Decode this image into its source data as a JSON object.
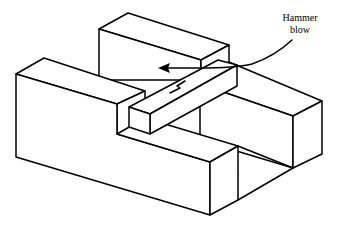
{
  "diagram": {
    "annotation": {
      "line1": "Hammer",
      "line2": "blow"
    },
    "colors": {
      "stroke": "#000000",
      "background": "#ffffff"
    }
  }
}
